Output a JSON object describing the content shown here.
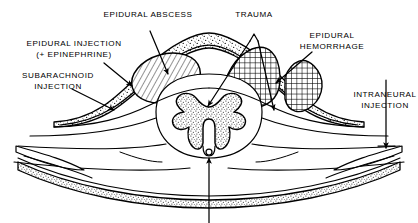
{
  "figure": {
    "kind": "medical-illustration",
    "palette": {
      "ink": "#000000",
      "paper": "#ffffff"
    }
  },
  "labels": [
    {
      "id": "epidural-abscess",
      "lines": [
        "EPIDURAL ABSCESS"
      ]
    },
    {
      "id": "epidural-injection",
      "lines": [
        "EPIDURAL INJECTION",
        "(+ EPINEPHRINE)"
      ]
    },
    {
      "id": "subarachnoid-injection",
      "lines": [
        "SUBARACHNOID",
        "INJECTION"
      ]
    },
    {
      "id": "trauma",
      "lines": [
        "TRAUMA"
      ]
    },
    {
      "id": "epidural-hemorrhage",
      "lines": [
        "EPIDURAL",
        "HEMORRHAGE"
      ]
    },
    {
      "id": "intraneural-injection",
      "lines": [
        "INTRANEURAL",
        "INJECTION"
      ]
    }
  ],
  "structures": [
    {
      "id": "epidural-fat",
      "texture": "stipple"
    },
    {
      "id": "abscess-mass",
      "texture": "diagonal-hatch"
    },
    {
      "id": "hemorrhage-mass",
      "texture": "cross-hatch"
    },
    {
      "id": "gray-matter",
      "texture": "stipple"
    },
    {
      "id": "vertebral-body",
      "texture": "stipple"
    },
    {
      "id": "central-canal",
      "texture": "open-circle"
    }
  ],
  "pointers": [
    {
      "id": "arrow-abscess",
      "target": "abscess-mass"
    },
    {
      "id": "arrow-epidural-injection",
      "target": "epidural-fat"
    },
    {
      "id": "arrow-subarachnoid",
      "target": "subarachnoid-space"
    },
    {
      "id": "arrow-trauma-cord",
      "target": "gray-matter"
    },
    {
      "id": "arrow-trauma-hemorrhage",
      "target": "hemorrhage-mass"
    },
    {
      "id": "arrow-hemorrhage",
      "target": "hemorrhage-mass"
    },
    {
      "id": "arrow-intraneural",
      "target": "nerve-root-right"
    },
    {
      "id": "arrow-unlabeled-bottom",
      "target": "central-canal"
    }
  ]
}
